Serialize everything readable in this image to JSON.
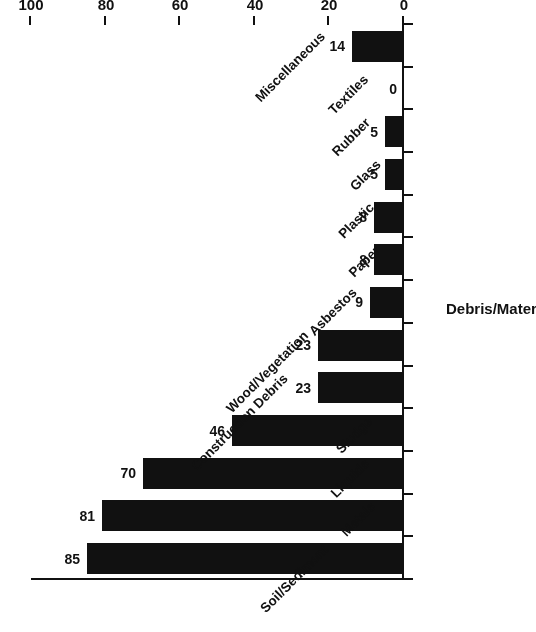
{
  "chart_data": {
    "type": "bar",
    "orientation": "horizontal",
    "title": "",
    "xlabel": "Debris/Material Type",
    "ylabel": "Number of Sites",
    "categories": [
      "Soil/Sediment",
      "Metals",
      "Liquids",
      "Sludge",
      "Construction Debris",
      "Wood/Vegetation",
      "Asbestos",
      "Paper",
      "Plastic",
      "Glass",
      "Rubber",
      "Textiles",
      "Miscellaneous"
    ],
    "values": [
      85,
      81,
      70,
      46,
      23,
      23,
      9,
      8,
      8,
      5,
      5,
      0,
      14
    ],
    "value_labels": [
      "85",
      "81",
      "70",
      "46",
      "23",
      "23",
      "9",
      "8",
      "8",
      "5",
      "5",
      "0",
      "14"
    ],
    "ylim": [
      0,
      100
    ],
    "tick_values": [
      0,
      20,
      40,
      60,
      80,
      100
    ],
    "tick_labels": [
      "0",
      "20",
      "40",
      "60",
      "80",
      "100"
    ],
    "grid": false,
    "legend": false,
    "bar_color": "#111111",
    "axis_color": "#111111",
    "background": "#ffffff",
    "rotated_180": true
  }
}
